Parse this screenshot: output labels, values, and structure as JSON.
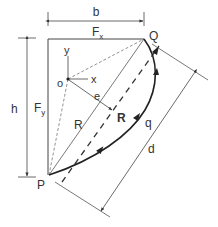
{
  "diagram": {
    "labels": {
      "b": "b",
      "fx_main": "F",
      "fx_sub": "x",
      "fy_main": "F",
      "fy_sub": "y",
      "h": "h",
      "q_point": "Q",
      "p_point": "P",
      "y_axis": "y",
      "x_axis": "x",
      "origin": "o",
      "e": "e",
      "r_radius": "R",
      "r_resultant": "R",
      "q_flow": "q",
      "d": "d"
    },
    "colors": {
      "line": "#333333",
      "dashed": "#666666",
      "thin": "#555555"
    }
  }
}
